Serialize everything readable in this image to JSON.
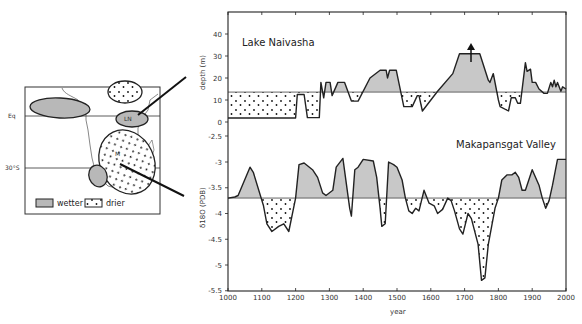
{
  "chart_data": [
    {
      "type": "area",
      "title": "Lake Naivasha",
      "xlabel": "year",
      "ylabel": "depth (m)",
      "xlim": [
        1000,
        2000
      ],
      "ylim": [
        -2.5,
        48
      ],
      "yticks": [
        40,
        30,
        20,
        10,
        0
      ],
      "baseline": 13.6,
      "fill_above": "wetter (gray)",
      "fill_below": "drier (dotted)",
      "annotation": "upward arrow near 1720 indicating depth above plotted range",
      "x": [
        1000,
        1200,
        1205,
        1225,
        1235,
        1270,
        1275,
        1283,
        1290,
        1302,
        1308,
        1325,
        1345,
        1365,
        1385,
        1420,
        1450,
        1468,
        1472,
        1478,
        1498,
        1520,
        1545,
        1560,
        1565,
        1575,
        1620,
        1665,
        1685,
        1745,
        1770,
        1775,
        1785,
        1800,
        1805,
        1830,
        1838,
        1850,
        1857,
        1865,
        1880,
        1885,
        1895,
        1900,
        1910,
        1920,
        1935,
        1945,
        1955,
        1960,
        1965,
        1970,
        1975,
        1985,
        1990,
        2000
      ],
      "values": [
        1.8,
        1.8,
        12.5,
        12.5,
        2,
        2,
        18,
        11,
        18,
        18,
        12,
        18,
        18,
        9.5,
        9.5,
        20,
        23.5,
        23.5,
        20,
        23.5,
        23.5,
        7,
        7,
        12,
        12,
        5,
        14,
        22,
        31,
        31,
        19,
        18,
        22,
        10,
        7,
        5,
        11,
        11,
        8.5,
        8.5,
        27,
        23,
        24,
        18,
        18,
        15,
        13,
        13,
        18,
        16,
        19,
        16,
        18,
        14,
        16,
        15
      ]
    },
    {
      "type": "area",
      "title": "Makapansgat Valley",
      "xlabel": "year",
      "ylabel": "δ18O (PDB)",
      "xlim": [
        1000,
        2000
      ],
      "ylim": [
        -5.5,
        -2.5
      ],
      "yticks": [
        -2.5,
        -3,
        -3.5,
        -4,
        -4.5,
        -5,
        -5.5
      ],
      "xticks": [
        1000,
        1100,
        1200,
        1300,
        1400,
        1500,
        1600,
        1700,
        1800,
        1900,
        2000
      ],
      "baseline": -3.7,
      "fill_above": "wetter (gray)",
      "fill_below": "drier (dotted)",
      "x": [
        1000,
        1020,
        1030,
        1065,
        1075,
        1105,
        1115,
        1130,
        1150,
        1165,
        1180,
        1200,
        1210,
        1225,
        1250,
        1265,
        1280,
        1290,
        1310,
        1320,
        1340,
        1360,
        1365,
        1375,
        1385,
        1400,
        1430,
        1440,
        1450,
        1455,
        1465,
        1475,
        1490,
        1500,
        1515,
        1525,
        1535,
        1545,
        1555,
        1565,
        1580,
        1595,
        1610,
        1620,
        1635,
        1650,
        1660,
        1670,
        1685,
        1695,
        1710,
        1720,
        1740,
        1750,
        1760,
        1770,
        1790,
        1800,
        1810,
        1825,
        1840,
        1850,
        1860,
        1870,
        1880,
        1900,
        1920,
        1930,
        1940,
        1950,
        1960,
        1975,
        2000
      ],
      "values": [
        -3.7,
        -3.68,
        -3.65,
        -3.1,
        -3.2,
        -3.85,
        -4.2,
        -4.35,
        -4.25,
        -4.2,
        -4.35,
        -3.7,
        -3.05,
        -3.02,
        -3.15,
        -3.3,
        -3.6,
        -3.65,
        -3.55,
        -3.1,
        -2.93,
        -3.9,
        -4.05,
        -3.15,
        -3.1,
        -2.95,
        -2.98,
        -3.3,
        -3.9,
        -4.25,
        -4.2,
        -3.0,
        -3.05,
        -3.1,
        -3.35,
        -3.7,
        -3.95,
        -4.0,
        -3.9,
        -3.95,
        -3.55,
        -3.8,
        -3.85,
        -4.0,
        -3.92,
        -3.7,
        -3.75,
        -3.95,
        -4.3,
        -4.4,
        -4.0,
        -4.1,
        -4.6,
        -5.3,
        -5.25,
        -4.6,
        -3.9,
        -3.7,
        -3.35,
        -3.25,
        -3.25,
        -3.2,
        -3.3,
        -3.55,
        -3.55,
        -3.15,
        -3.45,
        -3.7,
        -3.9,
        -3.75,
        -3.45,
        -2.95,
        -2.95
      ]
    }
  ],
  "map": {
    "lat_labels": [
      "Eq",
      "30°S"
    ],
    "site_labels": [
      "LN",
      "M"
    ],
    "legend": [
      {
        "label": "wetter",
        "style": "gray"
      },
      {
        "label": "drier",
        "style": "dotted"
      }
    ]
  },
  "colors": {
    "wetter_fill": "#c8c8c8",
    "line": "#222222",
    "baseline": "#555555"
  }
}
